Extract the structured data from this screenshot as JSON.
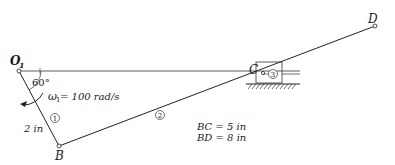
{
  "diagram": {
    "type": "slider-crank mechanism",
    "points": {
      "O1": {
        "label": "O",
        "sub": "1"
      },
      "B": {
        "label": "B"
      },
      "C": {
        "label": "C"
      },
      "D": {
        "label": "D"
      }
    },
    "links": [
      {
        "id": "1",
        "from": "O1",
        "to": "B",
        "label": "1"
      },
      {
        "id": "2",
        "from": "B",
        "to": "D",
        "label": "2"
      },
      {
        "id": "3",
        "type": "slider",
        "at": "C",
        "label": "3"
      }
    ],
    "annotations": {
      "angle": "60°",
      "omega_symbol": "ω",
      "omega_sub": "1",
      "omega_value": " = 100 rad/s",
      "link1_length": "2 in",
      "bc": "BC = 5 in",
      "bd": "BD = 8 in"
    }
  }
}
